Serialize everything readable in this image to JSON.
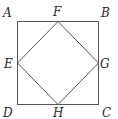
{
  "diagram": {
    "colors": {
      "line": "#555555",
      "text": "#2a2a2a",
      "background": "#ffffff"
    },
    "points": {
      "A": {
        "label": "A",
        "x": 17,
        "y": 21
      },
      "B": {
        "label": "B",
        "x": 98,
        "y": 21
      },
      "C": {
        "label": "C",
        "x": 98,
        "y": 104
      },
      "D": {
        "label": "D",
        "x": 17,
        "y": 104
      },
      "E": {
        "label": "E",
        "x": 17,
        "y": 63
      },
      "F": {
        "label": "F",
        "x": 58,
        "y": 21
      },
      "G": {
        "label": "G",
        "x": 98,
        "y": 63
      },
      "H": {
        "label": "H",
        "x": 58,
        "y": 104
      }
    },
    "outer_square": [
      "A",
      "B",
      "C",
      "D"
    ],
    "inner_square": [
      "F",
      "G",
      "H",
      "E"
    ]
  }
}
